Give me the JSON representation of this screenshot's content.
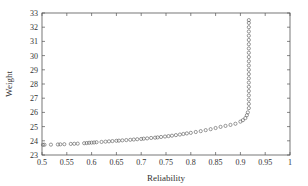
{
  "chart_data": {
    "type": "scatter",
    "title": "",
    "xlabel": "Reliability",
    "ylabel": "Weight",
    "xlim": [
      0.5,
      1.0
    ],
    "ylim": [
      23,
      33
    ],
    "xticks": [
      "0.5",
      "0.55",
      "0.6",
      "0.65",
      "0.7",
      "0.75",
      "0.8",
      "0.85",
      "0.9",
      "0.95",
      "1"
    ],
    "yticks": [
      "23",
      "24",
      "25",
      "26",
      "27",
      "28",
      "29",
      "30",
      "31",
      "32",
      "33"
    ],
    "grid": false,
    "legend": null,
    "marker": "open-circle",
    "series": [
      {
        "name": "Pareto front",
        "points": [
          [
            0.502,
            23.72
          ],
          [
            0.505,
            23.72
          ],
          [
            0.518,
            23.73
          ],
          [
            0.532,
            23.74
          ],
          [
            0.537,
            23.75
          ],
          [
            0.545,
            23.76
          ],
          [
            0.558,
            23.78
          ],
          [
            0.565,
            23.79
          ],
          [
            0.572,
            23.8
          ],
          [
            0.585,
            23.83
          ],
          [
            0.59,
            23.84
          ],
          [
            0.595,
            23.86
          ],
          [
            0.6,
            23.87
          ],
          [
            0.605,
            23.88
          ],
          [
            0.61,
            23.9
          ],
          [
            0.62,
            23.92
          ],
          [
            0.628,
            23.94
          ],
          [
            0.635,
            23.96
          ],
          [
            0.642,
            23.98
          ],
          [
            0.65,
            24.0
          ],
          [
            0.655,
            24.01
          ],
          [
            0.662,
            24.03
          ],
          [
            0.67,
            24.05
          ],
          [
            0.678,
            24.07
          ],
          [
            0.685,
            24.09
          ],
          [
            0.692,
            24.11
          ],
          [
            0.7,
            24.13
          ],
          [
            0.705,
            24.15
          ],
          [
            0.712,
            24.17
          ],
          [
            0.72,
            24.2
          ],
          [
            0.728,
            24.22
          ],
          [
            0.733,
            24.24
          ],
          [
            0.74,
            24.27
          ],
          [
            0.748,
            24.3
          ],
          [
            0.755,
            24.33
          ],
          [
            0.762,
            24.36
          ],
          [
            0.77,
            24.4
          ],
          [
            0.778,
            24.44
          ],
          [
            0.785,
            24.48
          ],
          [
            0.792,
            24.52
          ],
          [
            0.8,
            24.56
          ],
          [
            0.81,
            24.62
          ],
          [
            0.82,
            24.68
          ],
          [
            0.83,
            24.75
          ],
          [
            0.84,
            24.82
          ],
          [
            0.85,
            24.9
          ],
          [
            0.86,
            24.98
          ],
          [
            0.87,
            25.05
          ],
          [
            0.88,
            25.12
          ],
          [
            0.89,
            25.2
          ],
          [
            0.9,
            25.35
          ],
          [
            0.905,
            25.45
          ],
          [
            0.91,
            25.6
          ],
          [
            0.913,
            25.8
          ],
          [
            0.915,
            26.0
          ],
          [
            0.917,
            26.3
          ],
          [
            0.917,
            26.6
          ],
          [
            0.917,
            26.9
          ],
          [
            0.917,
            27.2
          ],
          [
            0.917,
            27.5
          ],
          [
            0.917,
            27.8
          ],
          [
            0.917,
            28.1
          ],
          [
            0.917,
            28.4
          ],
          [
            0.917,
            28.7
          ],
          [
            0.917,
            29.0
          ],
          [
            0.917,
            29.3
          ],
          [
            0.917,
            29.6
          ],
          [
            0.917,
            29.9
          ],
          [
            0.917,
            30.2
          ],
          [
            0.917,
            30.5
          ],
          [
            0.917,
            30.8
          ],
          [
            0.917,
            31.1
          ],
          [
            0.917,
            31.4
          ],
          [
            0.917,
            31.7
          ],
          [
            0.917,
            32.0
          ],
          [
            0.917,
            32.3
          ],
          [
            0.917,
            32.5
          ]
        ]
      }
    ]
  },
  "plot": {
    "left": 42,
    "right": 290,
    "top": 13,
    "bottom": 155,
    "marker_color": "#555555",
    "axis_color": "#555555"
  }
}
